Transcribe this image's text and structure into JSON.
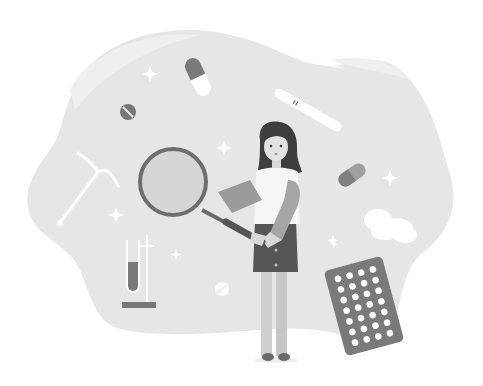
{
  "illustration": {
    "subject": "Woman examining contraceptive options with a magnifying glass",
    "background_color": "#ffffff",
    "palette": {
      "blob": "#e6e6e6",
      "blob_light": "#efefef",
      "dark": "#6e6e6e",
      "darker": "#4a4a4a",
      "mid": "#9a9a9a",
      "light": "#c8c8c8",
      "skin": "#dedede",
      "hair": "#3e3e3e",
      "white": "#ffffff",
      "shirt": "#f4f4f4",
      "skirt": "#555555",
      "legs": "#cfcfcf",
      "lens": "#d6d6d6"
    },
    "elements": [
      "background-blob",
      "capsule-pill-top",
      "round-tablet-left",
      "pregnancy-test-stick",
      "iud-device",
      "magnifying-glass",
      "woman",
      "test-tube-stand",
      "capsule-pill-right",
      "cloud",
      "round-tablet-bottom",
      "birth-control-pill-pack",
      "sparkles"
    ],
    "pill_pack": {
      "columns": 4,
      "rows": 7,
      "count": 28
    },
    "pregnancy_test_marks": "||"
  }
}
